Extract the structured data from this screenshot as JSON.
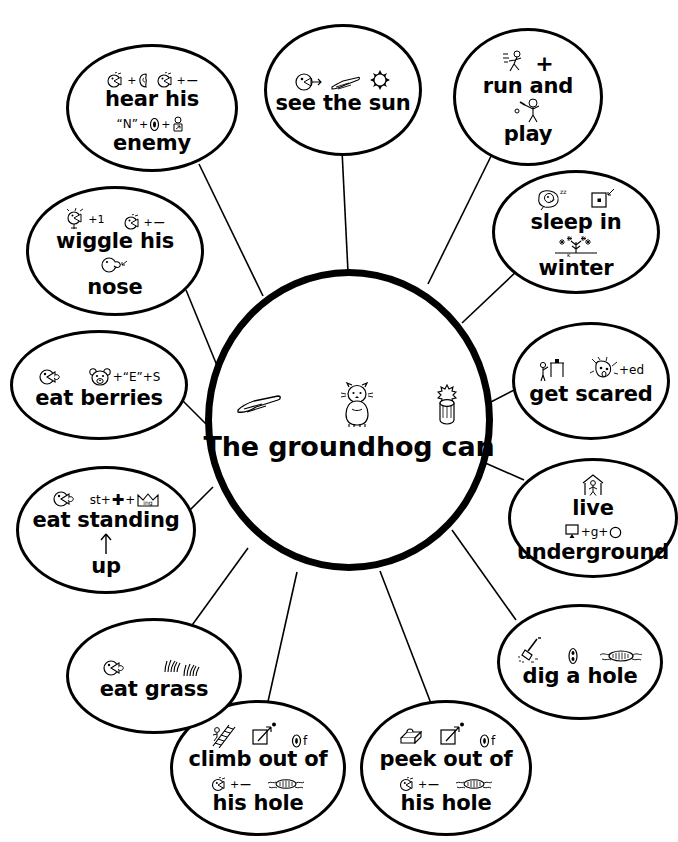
{
  "worksheet": {
    "center": {
      "text": "The groundhog can",
      "icons": [
        "pointing-hand-icon",
        "groundhog-icon",
        "bush-stump-icon"
      ]
    },
    "watermark": "",
    "nodes": [
      {
        "id": "hear-his-enemy",
        "lines": [
          "hear his",
          "enemy"
        ],
        "rebus_top": "ear-plus-ear",
        "rebus_mid": "\"N\"+0+person",
        "icons": [
          "listening-face-icon",
          "ear-icon",
          "listening-face-icon",
          "minus-icon",
          "enemy-person-icon"
        ]
      },
      {
        "id": "see-the-sun",
        "lines": [
          "see the sun"
        ],
        "rebus_top": "eye-arrow  hand  sun",
        "icons": [
          "eye-icon",
          "pointing-hand-icon",
          "sun-icon"
        ]
      },
      {
        "id": "run-and-play",
        "lines": [
          "run and",
          "play"
        ],
        "rebus_top": "runner plus",
        "rebus_mid": "ball-player",
        "icons": [
          "running-figure-icon",
          "plus-icon",
          "ball-player-icon"
        ]
      },
      {
        "id": "sleep-in-winter",
        "lines": [
          "sleep in",
          "winter"
        ],
        "rebus_top": "sleeping-face-zzz  box-dot",
        "rebus_mid": "snowy-tree",
        "icons": [
          "sleeping-face-icon",
          "box-in-icon",
          "snow-tree-icon"
        ]
      },
      {
        "id": "get-scared",
        "lines": [
          "get scared"
        ],
        "rebus_top": "person-get  scared-face+ed",
        "icons": [
          "get-figure-icon",
          "scared-face-icon"
        ]
      },
      {
        "id": "live-underground",
        "lines": [
          "live",
          "underground"
        ],
        "rebus_top": "house-figure",
        "rebus_mid": "under+g+O",
        "icons": [
          "house-person-icon",
          "under-box-icon",
          "circle-icon"
        ]
      },
      {
        "id": "dig-a-hole",
        "lines": [
          "dig a hole"
        ],
        "rebus_top": "shovel  a  hole",
        "icons": [
          "shovel-icon",
          "letter-a-icon",
          "hole-icon"
        ]
      },
      {
        "id": "peek-out-of-his-hole",
        "lines": [
          "peek out of",
          "his hole"
        ],
        "rebus_top": "peek-eyes  out-arrow  of",
        "rebus_mid": "his-face  hole",
        "icons": [
          "peeking-eyes-icon",
          "out-arrow-icon",
          "of-icon",
          "listening-face-icon",
          "hole-icon"
        ]
      },
      {
        "id": "climb-out-of-his-hole",
        "lines": [
          "climb out of",
          "his hole"
        ],
        "rebus_top": "ladder  out-arrow  of",
        "rebus_mid": "his-face  hole",
        "icons": [
          "ladder-icon",
          "out-arrow-icon",
          "of-icon",
          "listening-face-icon",
          "hole-icon"
        ]
      },
      {
        "id": "eat-grass",
        "lines": [
          "eat grass"
        ],
        "rebus_top": "eating-mouth  grass",
        "icons": [
          "eating-mouth-icon",
          "grass-icon"
        ]
      },
      {
        "id": "eat-standing-up",
        "lines": [
          "eat standing",
          "up"
        ],
        "rebus_top": "eating-mouth  st+plus+ing-crown",
        "rebus_mid": "up-arrow",
        "icons": [
          "eating-mouth-icon",
          "st-plus-ing-icon",
          "up-arrow-icon"
        ]
      },
      {
        "id": "eat-berries",
        "lines": [
          "eat berries"
        ],
        "rebus_top": "eating-mouth  bear+\"E\"+S",
        "icons": [
          "eating-mouth-icon",
          "bear-face-icon"
        ]
      },
      {
        "id": "wiggle-his-nose",
        "lines": [
          "wiggle his",
          "nose"
        ],
        "rebus_top": "wiggle-face+1  his-face",
        "rebus_mid": "nose-face",
        "icons": [
          "wiggle-face-icon",
          "listening-face-icon",
          "nose-face-icon"
        ]
      }
    ],
    "rebus_text": {
      "plus": "+",
      "minus": "—",
      "n_quote": "\"N\"",
      "zero": "0",
      "of": "f",
      "ed": "+ed",
      "one": "+1",
      "st": "st+",
      "ing": "ing",
      "e_quote": "\"E\"",
      "s": "S",
      "g": "+g+",
      "a": "a"
    }
  }
}
